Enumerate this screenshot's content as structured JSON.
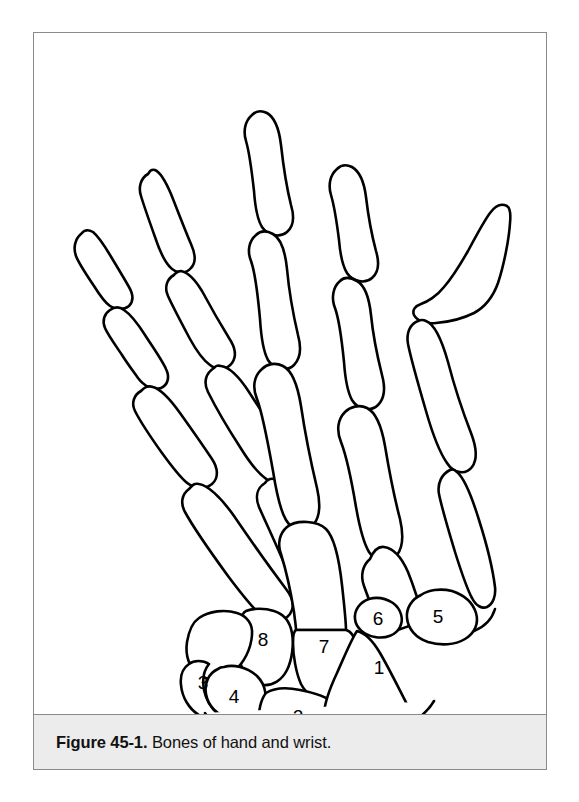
{
  "figure": {
    "caption_label": "Figure 45-1.",
    "caption_body": " Bones of hand and wrist.",
    "title": "Bones of hand and wrist",
    "frame_border_color": "#8a8a8a",
    "caption_background": "#ececec",
    "line_color": "#000000",
    "fill_color": "#ffffff"
  },
  "labels": [
    {
      "id": "1",
      "text": "1",
      "x": 345,
      "y": 636
    },
    {
      "id": "2",
      "text": "2",
      "x": 264,
      "y": 679
    },
    {
      "id": "3",
      "text": "3",
      "x": 169,
      "y": 644
    },
    {
      "id": "4",
      "text": "4",
      "x": 198,
      "y": 659
    },
    {
      "id": "5",
      "text": "5",
      "x": 400,
      "y": 580
    },
    {
      "id": "6",
      "text": "6",
      "x": 344,
      "y": 583
    },
    {
      "id": "7",
      "text": "7",
      "x": 289,
      "y": 605
    },
    {
      "id": "8",
      "text": "8",
      "x": 228,
      "y": 601
    }
  ],
  "anatomy": {
    "region": "hand and wrist",
    "view": "dorsal",
    "bone_groups": [
      "distal phalanges",
      "middle phalanges",
      "proximal phalanges",
      "metacarpals",
      "carpals"
    ],
    "numbered_count": 8
  }
}
